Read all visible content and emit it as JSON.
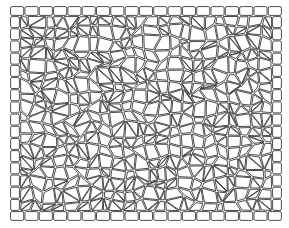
{
  "image": {
    "subject": "cobblestone paving pattern with rectangular block border",
    "width": 289,
    "height": 228,
    "background": "#ffffff",
    "stroke": "#3a3a3a",
    "fill": "#ffffff"
  },
  "frame": {
    "x": 10,
    "y": 6,
    "w": 272,
    "h": 215,
    "border_thickness": 10,
    "top_blocks": 19,
    "bottom_blocks": 19,
    "left_blocks": 16,
    "right_blocks": 16
  },
  "field": {
    "seed": 7,
    "cols": 22,
    "rows": 18,
    "gap": 1.1
  }
}
